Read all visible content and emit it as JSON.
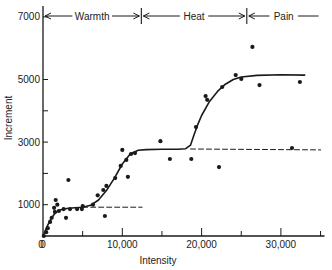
{
  "chart_data": {
    "type": "scatter",
    "title": "",
    "xlabel": "Intensity",
    "ylabel": "Increment",
    "xlim": [
      0,
      35000
    ],
    "ylim": [
      0,
      7000
    ],
    "grid": false,
    "x_ticks": [
      {
        "value": 0,
        "label": "0"
      },
      {
        "value": 5000,
        "label": ""
      },
      {
        "value": 10000,
        "label": "10,000"
      },
      {
        "value": 15000,
        "label": ""
      },
      {
        "value": 20000,
        "label": "20,000"
      },
      {
        "value": 25000,
        "label": ""
      },
      {
        "value": 30000,
        "label": "30,000"
      },
      {
        "value": 35000,
        "label": ""
      }
    ],
    "y_ticks": [
      {
        "value": 1000,
        "label": "1000"
      },
      {
        "value": 2000,
        "label": ""
      },
      {
        "value": 3000,
        "label": "3000"
      },
      {
        "value": 4000,
        "label": ""
      },
      {
        "value": 5000,
        "label": "5000"
      },
      {
        "value": 7000,
        "label": "7000"
      }
    ],
    "origin_label": "0",
    "phases": [
      {
        "label": "Warmth",
        "x_start": 0,
        "x_end": 12400
      },
      {
        "label": "Heat",
        "x_start": 12400,
        "x_end": 25700
      },
      {
        "label": "Pain",
        "x_start": 25700,
        "x_end": 35000
      }
    ],
    "series": [
      {
        "name": "observations",
        "kind": "scatter",
        "points": [
          [
            100,
            0
          ],
          [
            400,
            120
          ],
          [
            600,
            250
          ],
          [
            900,
            450
          ],
          [
            1100,
            580
          ],
          [
            1500,
            770
          ],
          [
            1600,
            1150
          ],
          [
            1800,
            1000
          ],
          [
            1400,
            900
          ],
          [
            2000,
            800
          ],
          [
            2900,
            580
          ],
          [
            2600,
            860
          ],
          [
            3400,
            860
          ],
          [
            4300,
            860
          ],
          [
            4900,
            860
          ],
          [
            5000,
            960
          ],
          [
            3200,
            1790
          ],
          [
            6300,
            1000
          ],
          [
            6900,
            1300
          ],
          [
            7600,
            1470
          ],
          [
            8000,
            1600
          ],
          [
            9100,
            1850
          ],
          [
            7800,
            640
          ],
          [
            10000,
            2750
          ],
          [
            9800,
            2240
          ],
          [
            10500,
            2430
          ],
          [
            11100,
            2620
          ],
          [
            11600,
            2650
          ],
          [
            10700,
            1890
          ],
          [
            14800,
            3030
          ],
          [
            16000,
            2460
          ],
          [
            18700,
            2460
          ],
          [
            22200,
            2200
          ],
          [
            19300,
            3480
          ],
          [
            20500,
            4470
          ],
          [
            20700,
            4350
          ],
          [
            22600,
            4760
          ],
          [
            24300,
            5140
          ],
          [
            25000,
            5020
          ],
          [
            26400,
            6040
          ],
          [
            27300,
            4820
          ],
          [
            32400,
            4920
          ],
          [
            31400,
            2810
          ]
        ]
      },
      {
        "name": "fitted curve",
        "kind": "line",
        "style": "solid",
        "points": [
          [
            0,
            0
          ],
          [
            500,
            300
          ],
          [
            1000,
            550
          ],
          [
            1500,
            720
          ],
          [
            2000,
            820
          ],
          [
            3000,
            880
          ],
          [
            4000,
            900
          ],
          [
            5000,
            920
          ],
          [
            6000,
            980
          ],
          [
            7000,
            1150
          ],
          [
            8000,
            1450
          ],
          [
            9000,
            1850
          ],
          [
            10000,
            2300
          ],
          [
            11000,
            2620
          ],
          [
            12000,
            2740
          ],
          [
            13000,
            2760
          ],
          [
            15000,
            2770
          ],
          [
            17000,
            2770
          ],
          [
            18000,
            2790
          ],
          [
            18600,
            2900
          ],
          [
            19000,
            3200
          ],
          [
            19500,
            3550
          ],
          [
            20000,
            3850
          ],
          [
            21000,
            4300
          ],
          [
            22000,
            4620
          ],
          [
            23000,
            4850
          ],
          [
            24000,
            5000
          ],
          [
            25000,
            5080
          ],
          [
            27000,
            5130
          ],
          [
            30000,
            5150
          ],
          [
            33000,
            5140
          ]
        ]
      },
      {
        "name": "warmth extrapolation",
        "kind": "line",
        "style": "dashed",
        "points": [
          [
            5000,
            920
          ],
          [
            12500,
            920
          ]
        ]
      },
      {
        "name": "heat extrapolation",
        "kind": "line",
        "style": "dashed",
        "points": [
          [
            18600,
            2780
          ],
          [
            35000,
            2750
          ]
        ]
      }
    ]
  }
}
